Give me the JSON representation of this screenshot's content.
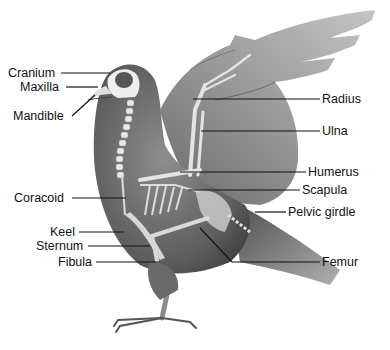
{
  "diagram": {
    "labels_left": [
      {
        "id": "cranium",
        "text": "Cranium",
        "x": 8,
        "y": 67
      },
      {
        "id": "maxilla",
        "text": "Maxilla",
        "x": 20,
        "y": 81
      },
      {
        "id": "mandible",
        "text": "Mandible",
        "x": 13,
        "y": 110
      },
      {
        "id": "coracoid",
        "text": "Coracoid",
        "x": 14,
        "y": 192
      },
      {
        "id": "keel",
        "text": "Keel",
        "x": 44,
        "y": 226
      },
      {
        "id": "sternum",
        "text": "Sternum",
        "x": 32,
        "y": 240
      },
      {
        "id": "fibula",
        "text": "Fibula",
        "x": 55,
        "y": 256
      }
    ],
    "labels_right": [
      {
        "id": "radius",
        "text": "Radius",
        "x": 322,
        "y": 92
      },
      {
        "id": "ulna",
        "text": "Ulna",
        "x": 322,
        "y": 123
      },
      {
        "id": "humerus",
        "text": "Humerus",
        "x": 308,
        "y": 166
      },
      {
        "id": "scapula",
        "text": "Scapula",
        "x": 302,
        "y": 183
      },
      {
        "id": "pelvic_girdle",
        "text": "Pelvic girdle",
        "x": 288,
        "y": 206
      },
      {
        "id": "femur",
        "text": "Femur",
        "x": 322,
        "y": 256
      }
    ],
    "colors": {
      "body_fill": "#6e6e6e",
      "wing_fill": "#8a8a8a",
      "bone": "#e6e6e6",
      "leader_line": "#111111",
      "text": "#111111"
    }
  }
}
